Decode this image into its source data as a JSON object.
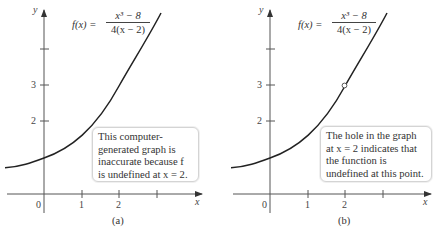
{
  "figure": {
    "panels": [
      {
        "id": "a",
        "caption": "(a)",
        "formula": {
          "lhs": "f(x) =",
          "numerator": "x³ − 8",
          "denominator": "4(x − 2)"
        },
        "axis_labels": {
          "x": "x",
          "y": "y"
        },
        "x_ticks": [
          "0",
          "1",
          "2"
        ],
        "y_ticks": [
          "2",
          "3"
        ],
        "note": "This computer-\ngenerated graph is\ninaccurate because f\nis undefined at x = 2.",
        "shows_hole": false
      },
      {
        "id": "b",
        "caption": "(b)",
        "formula": {
          "lhs": "f(x) =",
          "numerator": "x³ − 8",
          "denominator": "4(x − 2)"
        },
        "axis_labels": {
          "x": "x",
          "y": "y"
        },
        "x_ticks": [
          "0",
          "1",
          "2"
        ],
        "y_ticks": [
          "2",
          "3"
        ],
        "note": "The hole in the graph\nat x = 2 indicates that\nthe function is\nundefined at this point.",
        "shows_hole": true,
        "hole": {
          "x": 2,
          "y": 3
        }
      }
    ],
    "colors": {
      "curve": "#222222",
      "axis": "#555555",
      "note_border": "#d4d4d4"
    }
  }
}
